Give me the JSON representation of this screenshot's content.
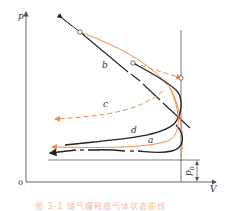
{
  "diagram": {
    "axes": {
      "y_label": "p",
      "x_label": "V",
      "origin_label": "0",
      "baseline_label": "p0",
      "baseline_label_main": "p",
      "baseline_label_sub": "0"
    },
    "curves": [
      {
        "id": "a",
        "label": "a",
        "color": "#f08a50",
        "style": "solid"
      },
      {
        "id": "b",
        "label": "b",
        "color": "#222222",
        "style": "dash-dot"
      },
      {
        "id": "c",
        "label": "c",
        "color": "#f08a50",
        "style": "dashed"
      },
      {
        "id": "d",
        "label": "d",
        "color": "#222222",
        "style": "solid"
      }
    ],
    "colors": {
      "orange": "#f08a50",
      "black": "#222222",
      "axis": "#555555"
    },
    "caption": "图 3-1  储气罐释放气体状态曲线"
  }
}
